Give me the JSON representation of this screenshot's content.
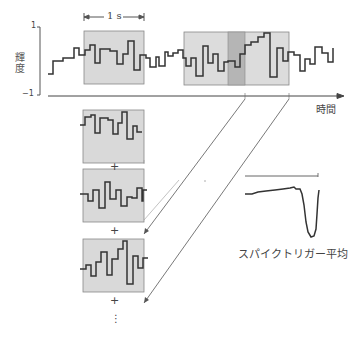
{
  "figure": {
    "y_axis": {
      "label": "輝度",
      "max_tick": "1",
      "min_tick": "−1"
    },
    "x_axis": {
      "label": "時間"
    },
    "window_scale": {
      "label": "1 s"
    },
    "result_label": "スパイクトリガー平均",
    "plus_sign": "+",
    "ellipsis": "⋮",
    "colors": {
      "window_fill": "#d9d9d9",
      "window_border": "#888888",
      "highlight_fill": "#b5b5b5",
      "trace": "#333333"
    }
  }
}
